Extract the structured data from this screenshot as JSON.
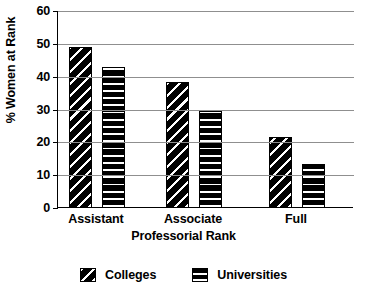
{
  "chart_data": {
    "type": "bar",
    "title": "",
    "xlabel": "Professorial Rank",
    "ylabel": "% Women at Rank",
    "categories": [
      "Assistant",
      "Associate",
      "Full"
    ],
    "series": [
      {
        "name": "Colleges",
        "values": [
          49,
          38.5,
          21.5
        ],
        "pattern": "diagonal-hatch"
      },
      {
        "name": "Universities",
        "values": [
          43,
          29.5,
          13.5
        ],
        "pattern": "horizontal-hatch"
      }
    ],
    "ylim": [
      0,
      60
    ],
    "yticks": [
      0,
      10,
      20,
      30,
      40,
      50,
      60
    ],
    "ytick_labels": [
      "0",
      "10",
      "20",
      "30",
      "40",
      "50",
      "60"
    ],
    "grid": true,
    "grid_axis": "y",
    "legend_position": "bottom",
    "colors": {
      "foreground": "#000000",
      "background": "#ffffff",
      "gridline": "#8f8f8f"
    }
  },
  "axes": {
    "y_title": "% Women at Rank",
    "x_title": "Professorial Rank",
    "y_ticks": [
      {
        "label": "60",
        "value": 60
      },
      {
        "label": "50",
        "value": 50
      },
      {
        "label": "40",
        "value": 40
      },
      {
        "label": "30",
        "value": 30
      },
      {
        "label": "20",
        "value": 20
      },
      {
        "label": "10",
        "value": 10
      },
      {
        "label": "0",
        "value": 0
      }
    ],
    "x_categories": [
      {
        "label": "Assistant"
      },
      {
        "label": "Associate"
      },
      {
        "label": "Full"
      }
    ]
  },
  "legend": {
    "items": [
      {
        "label": "Colleges"
      },
      {
        "label": "Universities"
      }
    ]
  }
}
